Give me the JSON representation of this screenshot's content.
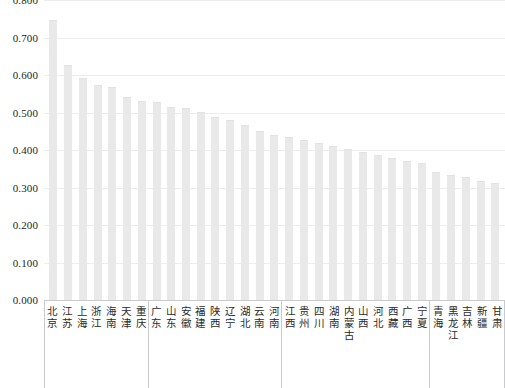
{
  "chart_data": {
    "type": "bar",
    "title": "",
    "subtitle": "",
    "xlabel": "",
    "ylabel": "",
    "ylim": [
      0.0,
      0.8
    ],
    "grid": true,
    "legend": false,
    "ytick_labels": [
      "0.800",
      "0.700",
      "0.600",
      "0.500",
      "0.400",
      "0.300",
      "0.200",
      "0.100",
      "0.000"
    ],
    "ytick_values": [
      0.8,
      0.7,
      0.6,
      0.5,
      0.4,
      0.3,
      0.2,
      0.1,
      0.0
    ],
    "bar_color": "#e9e9e9",
    "gridline_color": "#eceded",
    "axis_color": "#c9cacb",
    "categories": [
      "北京",
      "江苏",
      "上海",
      "浙江",
      "海南",
      "天津",
      "重庆",
      "广东",
      "山东",
      "安徽",
      "福建",
      "陕西",
      "辽宁",
      "湖北",
      "云南",
      "河南",
      "江西",
      "贵州",
      "四川",
      "湖南",
      "内蒙古",
      "山西",
      "河北",
      "西藏",
      "广西",
      "宁夏",
      "青海",
      "黑龙江",
      "吉林",
      "新疆",
      "甘肃"
    ],
    "values": [
      0.746,
      0.628,
      0.591,
      0.573,
      0.569,
      0.541,
      0.532,
      0.527,
      0.515,
      0.512,
      0.502,
      0.489,
      0.479,
      0.466,
      0.452,
      0.441,
      0.434,
      0.427,
      0.419,
      0.411,
      0.403,
      0.396,
      0.387,
      0.379,
      0.372,
      0.366,
      0.341,
      0.333,
      0.329,
      0.317,
      0.313
    ],
    "groups": [
      {
        "title": "",
        "count": 7
      },
      {
        "title": "",
        "count": 9
      },
      {
        "title": "",
        "count": 10
      },
      {
        "title": "",
        "count": 5
      }
    ]
  }
}
